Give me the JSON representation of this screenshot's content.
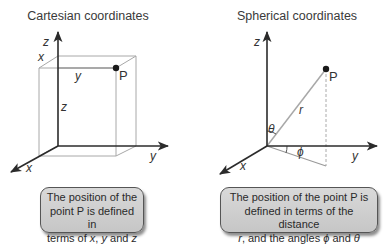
{
  "panels": [
    {
      "id": "cartesian",
      "title": "Cartesian coordinates",
      "labels": {
        "z_axis": "z",
        "x_edge": "x",
        "y_edge": "y",
        "point": "P",
        "z_edge": "z",
        "y_axis": "y",
        "x_axis": "x"
      },
      "caption": {
        "line1": "The position of the",
        "line2": "point P is defined in",
        "line3_prefix": "terms of ",
        "var1": "x",
        "sep1": ", ",
        "var2": "y",
        "sep2": " and ",
        "var3": "z"
      }
    },
    {
      "id": "spherical",
      "title": "Spherical coordinates",
      "labels": {
        "z_axis": "z",
        "point": "P",
        "radius": "r",
        "theta": "θ",
        "phi": "ϕ",
        "y_axis": "y",
        "x_axis": "x"
      },
      "caption": {
        "line1": "The position of the point P is",
        "line2": "defined in terms of the distance",
        "var_r": "r",
        "line3_mid": ", and the angles ",
        "var_phi": "ϕ",
        "line3_and": " and ",
        "var_theta": "θ"
      }
    }
  ],
  "colors": {
    "axis": "#2b2b2b",
    "box_edge": "#a8a8a8",
    "caption_fill": "#cfcfcf",
    "caption_border": "#555555"
  }
}
